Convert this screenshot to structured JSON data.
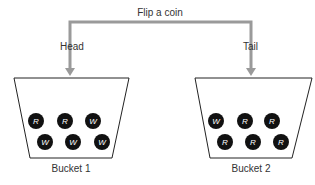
{
  "diagram": {
    "title": "Flip a coin",
    "branches": [
      {
        "label": "Head",
        "target": "Bucket 1"
      },
      {
        "label": "Tail",
        "target": "Bucket 2"
      }
    ],
    "buckets": [
      {
        "name": "Bucket 1",
        "balls": [
          "R",
          "R",
          "W",
          "W",
          "W",
          "W"
        ]
      },
      {
        "name": "Bucket 2",
        "balls": [
          "W",
          "R",
          "R",
          "R",
          "R",
          "R"
        ]
      }
    ],
    "colors": {
      "arrow": "#9a9a9a",
      "ball": "#111111",
      "outline": "#222222"
    }
  }
}
